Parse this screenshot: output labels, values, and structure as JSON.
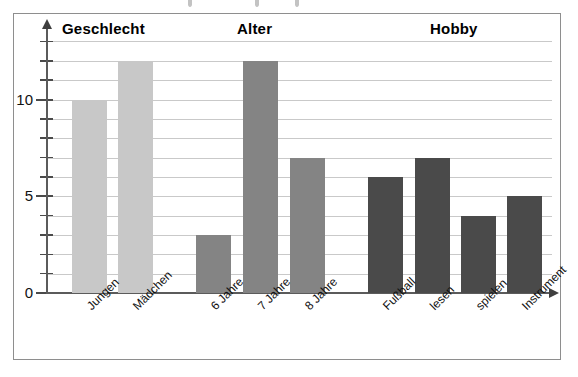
{
  "chart_data": {
    "type": "bar",
    "title": "",
    "xlabel": "",
    "ylabel": "",
    "ylim": [
      0,
      13
    ],
    "grid": true,
    "legend": "none",
    "y_ticks": [
      0,
      1,
      2,
      3,
      4,
      5,
      6,
      7,
      8,
      9,
      10,
      11,
      12,
      13
    ],
    "y_tick_labels": [
      "0",
      "5",
      "10"
    ],
    "y_labelled_values": [
      0,
      5,
      10
    ],
    "group_titles": [
      "Geschlecht",
      "Alter",
      "Hobby"
    ],
    "categories": [
      "Jungen",
      "Mädchen",
      "6 Jahre",
      "7 Jahre",
      "8 Jahre",
      "Fußball",
      "lesen",
      "spielen",
      "Instrument"
    ],
    "values": [
      10,
      12,
      3,
      12,
      7,
      6,
      7,
      4,
      5
    ],
    "groups": [
      {
        "name": "Geschlecht",
        "color": "#c8c8c8",
        "categories": [
          "Jungen",
          "Mädchen"
        ],
        "values": [
          10,
          12
        ]
      },
      {
        "name": "Alter",
        "color": "#848484",
        "categories": [
          "6 Jahre",
          "7 Jahre",
          "8 Jahre"
        ],
        "values": [
          3,
          12,
          7
        ]
      },
      {
        "name": "Hobby",
        "color": "#4a4a4a",
        "categories": [
          "Fußball",
          "lesen",
          "spielen",
          "Instrument"
        ],
        "values": [
          6,
          7,
          4,
          5
        ]
      }
    ],
    "colors": {
      "group_geschlecht": "#c8c8c8",
      "group_alter": "#848484",
      "group_hobby": "#4a4a4a",
      "gridline": "#c9c9c9",
      "axis": "#5b5b5b",
      "frame": "#8e8e8e",
      "background": "#ffffff",
      "text": "#000000"
    }
  },
  "bars": [
    {
      "label": "Jungen",
      "value": 10,
      "group": "Geschlecht",
      "color": "#c8c8c8",
      "x": 72,
      "width": 35
    },
    {
      "label": "Mädchen",
      "value": 12,
      "group": "Geschlecht",
      "color": "#c8c8c8",
      "x": 118,
      "width": 35
    },
    {
      "label": "6 Jahre",
      "value": 3,
      "group": "Alter",
      "color": "#848484",
      "x": 196,
      "width": 35
    },
    {
      "label": "7 Jahre",
      "value": 12,
      "group": "Alter",
      "color": "#848484",
      "x": 243,
      "width": 35
    },
    {
      "label": "8 Jahre",
      "value": 7,
      "group": "Alter",
      "color": "#848484",
      "x": 290,
      "width": 35
    },
    {
      "label": "Fußball",
      "value": 6,
      "group": "Hobby",
      "color": "#4a4a4a",
      "x": 368,
      "width": 35
    },
    {
      "label": "lesen",
      "value": 7,
      "group": "Hobby",
      "color": "#4a4a4a",
      "x": 415,
      "width": 35
    },
    {
      "label": "spielen",
      "value": 4,
      "group": "Hobby",
      "color": "#4a4a4a",
      "x": 461,
      "width": 35
    },
    {
      "label": "Instrument",
      "value": 5,
      "group": "Hobby",
      "color": "#4a4a4a",
      "x": 507,
      "width": 35
    }
  ],
  "group_headings": [
    {
      "text": "Geschlecht",
      "x": 62
    },
    {
      "text": "Alter",
      "x": 237
    },
    {
      "text": "Hobby",
      "x": 430
    }
  ],
  "y_axis": {
    "labels": [
      {
        "text": "10",
        "value": 10
      },
      {
        "text": "5",
        "value": 5
      },
      {
        "text": "0",
        "value": 0
      }
    ]
  },
  "axis_icons": {
    "y_arrow": "arrow-up-icon",
    "x_arrow": "arrow-right-icon"
  }
}
